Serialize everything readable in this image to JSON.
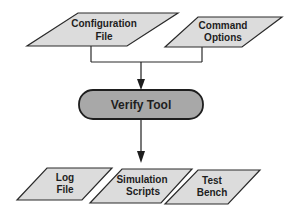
{
  "diagram": {
    "type": "flowchart",
    "colors": {
      "io_fill": "#dcdcdc",
      "process_fill": "#a8a8a8",
      "stroke": "#2a2a2a",
      "background": "#ffffff"
    },
    "inputs": [
      {
        "id": "config",
        "line1": "Configuration",
        "line2": "File"
      },
      {
        "id": "options",
        "line1": "Command",
        "line2": "Options"
      }
    ],
    "process": {
      "id": "verify",
      "label": "Verify Tool"
    },
    "outputs": [
      {
        "id": "log",
        "line1": "Log",
        "line2": "File"
      },
      {
        "id": "sim",
        "line1": "Simulation",
        "line2": "Scripts"
      },
      {
        "id": "bench",
        "line1": "Test",
        "line2": "Bench"
      }
    ],
    "edges": [
      {
        "from": "config",
        "to": "verify"
      },
      {
        "from": "options",
        "to": "verify"
      },
      {
        "from": "verify",
        "to": "log"
      },
      {
        "from": "verify",
        "to": "sim"
      },
      {
        "from": "verify",
        "to": "bench"
      }
    ]
  }
}
